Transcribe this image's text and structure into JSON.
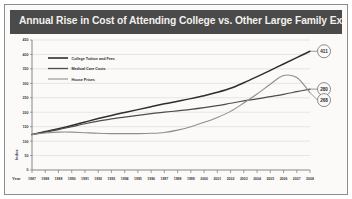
{
  "header": {
    "title": "Annual Rise in Cost of Attending College vs. Other Large Family Expenditures"
  },
  "chart_data": {
    "type": "line",
    "title": "Annual Rise in Cost of Attending College vs. Other Large Family Expenditures",
    "xlabel": "Year",
    "ylabel": "Index",
    "xlim": [
      1987,
      2008
    ],
    "ylim": [
      0,
      450
    ],
    "grid": true,
    "legend_position": "top-left",
    "yticks": [
      0,
      50,
      100,
      150,
      200,
      250,
      300,
      350,
      400,
      450
    ],
    "ytick_labels": [
      "0",
      "50",
      "100",
      "150",
      "200",
      "250",
      "300",
      "350",
      "400",
      "450"
    ],
    "x": [
      1987,
      1988,
      1989,
      1990,
      1991,
      1992,
      1993,
      1994,
      1995,
      1996,
      1997,
      1998,
      1999,
      2000,
      2001,
      2002,
      2003,
      2004,
      2005,
      2006,
      2007,
      2008
    ],
    "xtick_labels": [
      "1987",
      "1988",
      "1989",
      "1990",
      "1991",
      "1992",
      "1993",
      "1994",
      "1995",
      "1996",
      "1997",
      "1998",
      "1999",
      "2000",
      "2001",
      "2002",
      "2003",
      "2004",
      "2005",
      "2006",
      "2007",
      "2008"
    ],
    "series": [
      {
        "name": "College Tuition and Fees",
        "color": "#2e2e2e",
        "end_label": "411",
        "values": [
          123,
          133,
          143,
          154,
          166,
          178,
          189,
          199,
          209,
          219,
          229,
          238,
          247,
          257,
          269,
          283,
          302,
          323,
          345,
          367,
          389,
          411
        ]
      },
      {
        "name": "Medical Care Costs",
        "color": "#4d4d4d",
        "end_label": "280",
        "values": [
          123,
          131,
          140,
          150,
          160,
          169,
          177,
          183,
          189,
          195,
          200,
          205,
          210,
          216,
          223,
          231,
          239,
          246,
          254,
          262,
          271,
          280
        ]
      },
      {
        "name": "House Prices",
        "color": "#8e8e8e",
        "end_label": "268",
        "values": [
          123,
          128,
          131,
          131,
          129,
          127,
          126,
          126,
          126,
          127,
          130,
          138,
          150,
          165,
          182,
          203,
          232,
          263,
          297,
          327,
          320,
          268
        ]
      }
    ],
    "annotations": [
      {
        "label": "411",
        "series": "College Tuition and Fees",
        "year": 2008
      },
      {
        "label": "280",
        "series": "Medical Care Costs",
        "year": 2008
      },
      {
        "label": "268",
        "series": "House Prices",
        "year": 2008
      }
    ]
  }
}
